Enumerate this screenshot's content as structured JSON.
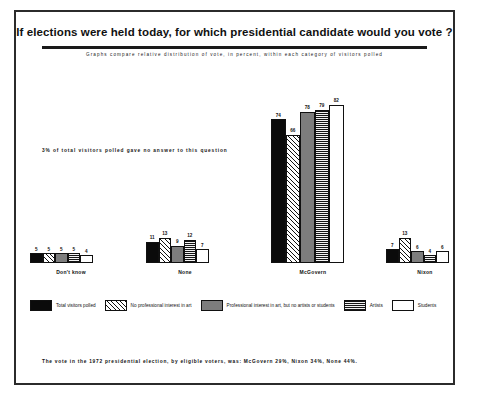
{
  "title": "If elections were held today, for which presidential candidate would you vote ?",
  "subtitle": "Graphs compare relative distribution of vote, in percent, within each category of visitors polled",
  "note": "3% of total visitors polled gave no answer to this question",
  "footer": "The vote in the 1972 presidential election, by eligible voters, was: McGovern 29%, Nixon 34%,   None 44%.",
  "legend": [
    {
      "label": "Total visitors polled",
      "pattern": "solid-black",
      "color": "#0b0b0b"
    },
    {
      "label": "No professional interest in art",
      "pattern": "diagonal-hatch",
      "color": "#ffffff"
    },
    {
      "label": "Professional interest in art, but no artists or students",
      "pattern": "solid-gray",
      "color": "#7d7d7d"
    },
    {
      "label": "Artists",
      "pattern": "cross-hatch-grid",
      "color": "#bdbdbd"
    },
    {
      "label": "Students",
      "pattern": "white",
      "color": "#ffffff"
    }
  ],
  "chart_data": {
    "type": "bar",
    "title": "If elections were held today, for which presidential candidate would you vote ?",
    "subtitle": "Graphs compare relative distribution of vote, in percent, within each category of visitors polled",
    "xlabel": "",
    "ylabel": "Percent of vote",
    "ylim": [
      0,
      85
    ],
    "grid": false,
    "legend_position": "bottom",
    "categories": [
      "Don't know",
      "None",
      "McGovern",
      "Nixon"
    ],
    "series": [
      {
        "name": "Total visitors polled",
        "values": [
          5,
          11,
          74,
          7
        ]
      },
      {
        "name": "No professional interest in art",
        "values": [
          5,
          13,
          66,
          13
        ]
      },
      {
        "name": "Professional interest in art, but no artists or students",
        "values": [
          5,
          9,
          78,
          6
        ]
      },
      {
        "name": "Artists",
        "values": [
          5,
          12,
          79,
          4
        ]
      },
      {
        "name": "Students",
        "values": [
          4,
          7,
          82,
          6
        ]
      }
    ],
    "annotations": [
      "3% of total visitors polled gave no answer to this question",
      "The vote in the 1972 presidential election, by eligible voters, was: McGovern 29%, Nixon 34%,   None 44%."
    ]
  }
}
